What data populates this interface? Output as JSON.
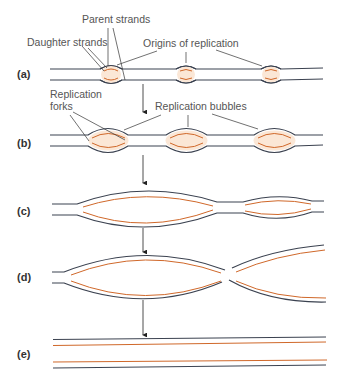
{
  "colors": {
    "parent_strand": "#3b4250",
    "daughter_strand": "#d0682a",
    "bubble_fill": "#fbe7d6",
    "leader": "#333333",
    "label": "#555555"
  },
  "labels": {
    "parent_strands": "Parent strands",
    "daughter_strands": "Daughter strands",
    "origins_of_replication": "Origins of replication",
    "replication_forks": "Replication\nforks",
    "replication_forks_line1": "Replication",
    "replication_forks_line2": "forks",
    "replication_bubbles": "Replication bubbles"
  },
  "panels": [
    {
      "id": "a",
      "label": "(a)",
      "stage": "Origins of replication with small bubbles"
    },
    {
      "id": "b",
      "label": "(b)",
      "stage": "Replication bubbles enlarge; forks move outward"
    },
    {
      "id": "c",
      "label": "(c)",
      "stage": "Bubbles grow and approach each other"
    },
    {
      "id": "d",
      "label": "(d)",
      "stage": "Bubbles fuse"
    },
    {
      "id": "e",
      "label": "(e)",
      "stage": "Two complete daughter DNA molecules"
    }
  ]
}
